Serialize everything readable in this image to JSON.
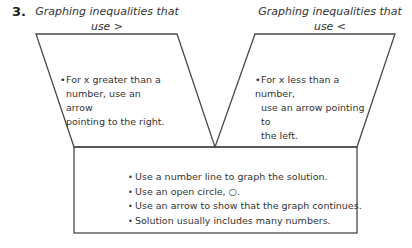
{
  "problem_number": "3.",
  "left_panel": {
    "heading": "Graphing inequalities that use >",
    "heading_line1": "Graphing inequalities that",
    "heading_line2": "use >",
    "bullet": "For x greater than a number, use an arrow pointing to the right.",
    "bullet_lines": [
      "For x greater than a",
      "number, use an arrow",
      "pointing to the right."
    ]
  },
  "right_panel": {
    "heading": "Graphing inequalities that use <",
    "heading_line1": "Graphing inequalities that",
    "heading_line2": "use <",
    "bullet": "For x less than a number, use an arrow pointing to the left.",
    "bullet_lines": [
      "For x less than a number,",
      "use an arrow pointing to",
      "the left."
    ]
  },
  "shared_box": {
    "bullets": [
      "Use a number line to graph the solution.",
      "Use an open circle, ○.",
      "Use an arrow to show that the graph continues.",
      "Solution usually includes many numbers."
    ]
  },
  "colors": {
    "stroke": "#4a4a4a",
    "text": "#333333",
    "background": "#ffffff"
  }
}
